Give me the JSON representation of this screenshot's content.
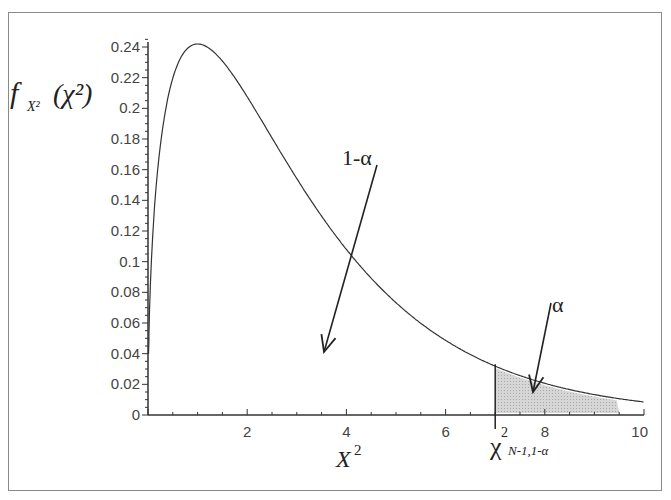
{
  "chart_data": {
    "type": "line",
    "title": "",
    "xlabel": "X²",
    "ylabel": "f_X²(χ²)",
    "xlim": [
      0,
      10
    ],
    "ylim": [
      0,
      0.245
    ],
    "x_ticks": [
      2,
      4,
      6,
      8,
      10
    ],
    "y_ticks": [
      0,
      0.02,
      0.04,
      0.06,
      0.08,
      0.1,
      0.12,
      0.14,
      0.16,
      0.18,
      0.2,
      0.22,
      0.24
    ],
    "x_tick_labels": [
      "2",
      "4",
      "6",
      "8",
      "10"
    ],
    "y_tick_labels": [
      "0",
      "0.02",
      "0.04",
      "0.06",
      "0.08",
      "0.1",
      "0.12",
      "0.14",
      "0.16",
      "0.18",
      "0.2",
      "0.22",
      "0.24"
    ],
    "grid": false,
    "series": [
      {
        "name": "chi-square pdf (df=3)",
        "x": [
          0.05,
          0.25,
          0.5,
          1,
          1.5,
          2,
          3,
          4,
          5,
          6,
          7,
          8,
          9,
          10
        ],
        "values": [
          0.087,
          0.172,
          0.22,
          0.242,
          0.231,
          0.208,
          0.154,
          0.108,
          0.073,
          0.048,
          0.032,
          0.021,
          0.013,
          0.0085
        ]
      }
    ],
    "critical_value": 7.0,
    "shaded_region": {
      "from": 7.0,
      "to": 9.5
    },
    "annotations": [
      {
        "text": "1-α",
        "arrow_to": [
          3.5,
          0.033
        ]
      },
      {
        "text": "α",
        "arrow_to": [
          7.6,
          0.01
        ]
      },
      {
        "text": "χ²",
        "subscript": "N-1,1-α",
        "at_x": 7.0
      }
    ]
  },
  "labels": {
    "y_axis_f": "f",
    "y_axis_sub": "X²",
    "y_axis_arg": "(χ²)",
    "x_axis_X": "X",
    "x_axis_sup": "2",
    "ann_one_minus_alpha": "1-α",
    "ann_alpha": "α",
    "crit_chi": "χ",
    "crit_sup": "2",
    "crit_sub": "N-1,1-α"
  }
}
